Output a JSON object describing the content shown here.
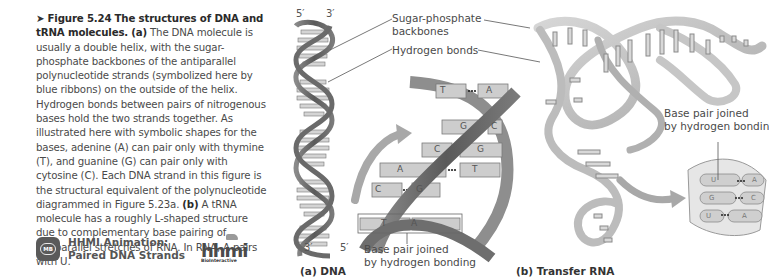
{
  "caption": {
    "arrow": "➤",
    "figure_number": "Figure 5.24",
    "title": "The structures of DNA and tRNA molecules.",
    "part_a_marker": "(a)",
    "part_a_text": "The DNA molecule is usually a double helix, with the sugar-phosphate backbones of the antiparallel polynucleotide strands (symbolized here by blue ribbons) on the outside of the helix. Hydrogen bonds between pairs of nitrogenous bases hold the two strands together. As illustrated here with symbolic shapes for the bases, adenine (A) can pair only with thymine (T), and guanine (G) can pair only with cytosine (C). Each DNA strand in this figure is the structural equivalent of the polynucleotide diagrammed in Figure 5.23a.",
    "part_b_marker": "(b)",
    "part_b_text": "A tRNA molecule has a roughly L-shaped structure due to complementary base pairing of antiparallel stretches of RNA. In RNA, A pairs with U."
  },
  "media": {
    "icon": "mastering-biology-icon",
    "icon_text": "MB",
    "line1": "HHMI Animation:",
    "line2": "Paired DNA Strands",
    "logo_text": "hhmi",
    "logo_sub": "BioInteractive"
  },
  "dna_panel": {
    "top_left_end": "5′",
    "top_right_end": "3′",
    "bottom_left_end": "3′",
    "bottom_right_end": "5′",
    "label_backbones_line1": "Sugar-phosphate",
    "label_backbones_line2": "backbones",
    "label_hbonds": "Hydrogen bonds",
    "base_pairs": [
      {
        "left": "T",
        "right": "A"
      },
      {
        "left": "G",
        "right": "C"
      },
      {
        "left": "C",
        "right": "G"
      },
      {
        "left": "A",
        "right": "T"
      },
      {
        "left": "C",
        "right": "G"
      },
      {
        "left": "T",
        "right": "A"
      }
    ],
    "callout_line1": "Base pair joined",
    "callout_line2": "by hydrogen bonding",
    "panel_label": "(a) DNA"
  },
  "trna_panel": {
    "callout_line1": "Base pair joined",
    "callout_line2": "by hydrogen bonding",
    "inset_pairs": [
      {
        "left": "U",
        "right": "A"
      },
      {
        "left": "G",
        "right": "C"
      },
      {
        "left": "U",
        "right": "A"
      }
    ],
    "panel_label": "(b) Transfer RNA"
  },
  "colors": {
    "ribbon_dark": "#5e5e5e",
    "ribbon_light": "#b8b8b8",
    "base_fill": "#cfcfcf",
    "text": "#4a4a4a",
    "arrow": "#9a9a9a"
  }
}
